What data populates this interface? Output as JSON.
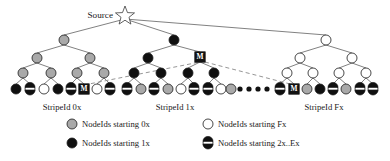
{
  "figure": {
    "source_label": "Source",
    "palette": {
      "gray_0x": "#a9a9a9",
      "black_1x": "#101010",
      "white_Fx": "#ffffff",
      "half_2xEx_top": "#ffffff",
      "half_2xEx_bottom": "#101010",
      "outline": "#1a1a1a",
      "edge": "#4a4a4a",
      "dashed_edge": "#8a8a8a",
      "mbox_fill": "#121212",
      "mbox_text": "#ffffff"
    },
    "mbox_label": "M"
  },
  "stripes": [
    {
      "id": "stripe-0x",
      "label": "StripeId 0x",
      "label_x": 62,
      "label_y": 110,
      "root": {
        "x": 64,
        "y": 40,
        "kind": "gray"
      },
      "level2": [
        {
          "x": 37,
          "y": 58,
          "kind": "gray"
        },
        {
          "x": 90,
          "y": 58,
          "kind": "gray"
        }
      ],
      "level3": [
        {
          "x": 23,
          "y": 73,
          "kind": "gray"
        },
        {
          "x": 51,
          "y": 73,
          "kind": "gray"
        },
        {
          "x": 77,
          "y": 73,
          "kind": "gray"
        },
        {
          "x": 104,
          "y": 73,
          "kind": "gray"
        }
      ],
      "leaves": [
        {
          "x": 16,
          "y": 89,
          "kind": "black"
        },
        {
          "x": 30,
          "y": 89,
          "kind": "half"
        },
        {
          "x": 44,
          "y": 89,
          "kind": "white"
        },
        {
          "x": 58,
          "y": 89,
          "kind": "black"
        },
        {
          "x": 71,
          "y": 89,
          "kind": "half"
        },
        {
          "x": 84,
          "y": 89,
          "kind": "mbox"
        },
        {
          "x": 97,
          "y": 89,
          "kind": "white"
        },
        {
          "x": 110,
          "y": 89,
          "kind": "half"
        }
      ]
    },
    {
      "id": "stripe-1x",
      "label": "StripeId 1x",
      "label_x": 175,
      "label_y": 110,
      "root": {
        "x": 174,
        "y": 40,
        "kind": "black"
      },
      "level2": [
        {
          "x": 148,
          "y": 58,
          "kind": "black"
        },
        {
          "x": 200,
          "y": 57,
          "kind": "mbox"
        }
      ],
      "level3": [
        {
          "x": 134,
          "y": 73,
          "kind": "black"
        },
        {
          "x": 161,
          "y": 73,
          "kind": "black"
        },
        {
          "x": 188,
          "y": 73,
          "kind": "black"
        },
        {
          "x": 214,
          "y": 73,
          "kind": "black"
        }
      ],
      "leaves": [
        {
          "x": 127,
          "y": 89,
          "kind": "half"
        },
        {
          "x": 141,
          "y": 89,
          "kind": "gray"
        },
        {
          "x": 154,
          "y": 89,
          "kind": "half"
        },
        {
          "x": 168,
          "y": 89,
          "kind": "gray"
        },
        {
          "x": 181,
          "y": 89,
          "kind": "white"
        },
        {
          "x": 194,
          "y": 89,
          "kind": "half"
        },
        {
          "x": 208,
          "y": 89,
          "kind": "half"
        },
        {
          "x": 221,
          "y": 89,
          "kind": "white"
        }
      ]
    },
    {
      "id": "stripe-Fx",
      "label": "StripeId Fx",
      "label_x": 324,
      "label_y": 110,
      "root": {
        "x": 326,
        "y": 40,
        "kind": "white"
      },
      "level2": [
        {
          "x": 300,
          "y": 58,
          "kind": "white"
        },
        {
          "x": 352,
          "y": 58,
          "kind": "white"
        },
        {
          "x": 231,
          "y": 89,
          "kind": "gray"
        }
      ],
      "level3": [
        {
          "x": 287,
          "y": 73,
          "kind": "white"
        },
        {
          "x": 313,
          "y": 73,
          "kind": "white"
        },
        {
          "x": 339,
          "y": 73,
          "kind": "white"
        },
        {
          "x": 366,
          "y": 73,
          "kind": "white"
        }
      ],
      "leaves": [
        {
          "x": 280,
          "y": 89,
          "kind": "half"
        },
        {
          "x": 294,
          "y": 89,
          "kind": "mbox"
        },
        {
          "x": 307,
          "y": 89,
          "kind": "gray"
        },
        {
          "x": 320,
          "y": 89,
          "kind": "black"
        },
        {
          "x": 333,
          "y": 89,
          "kind": "half"
        },
        {
          "x": 346,
          "y": 89,
          "kind": "gray"
        },
        {
          "x": 360,
          "y": 89,
          "kind": "half"
        },
        {
          "x": 373,
          "y": 89,
          "kind": "half"
        }
      ]
    }
  ],
  "ellipsis": {
    "label": "....",
    "dots": 4,
    "x_start": 240,
    "y": 89,
    "spacing": 9,
    "radius": 2.6
  },
  "legend": {
    "items": [
      {
        "id": "legend-0x",
        "kind": "gray",
        "text": "NodeIds starting 0x",
        "marker_x": 72,
        "text_x": 82,
        "y": 127
      },
      {
        "id": "legend-Fx",
        "kind": "white",
        "text": "NodeIds starting Fx",
        "marker_x": 208,
        "text_x": 218,
        "y": 127
      },
      {
        "id": "legend-1x",
        "kind": "black",
        "text": "NodeIds starting 1x",
        "marker_x": 72,
        "text_x": 82,
        "y": 146
      },
      {
        "id": "legend-2x",
        "kind": "half",
        "text": "NodeIds starting 2x..Ex",
        "marker_x": 208,
        "text_x": 218,
        "y": 146
      }
    ]
  },
  "source_star": {
    "cx": 125,
    "cy": 16,
    "outer_r": 10,
    "inner_r": 4.2,
    "label_x": 113,
    "label_y": 18
  }
}
